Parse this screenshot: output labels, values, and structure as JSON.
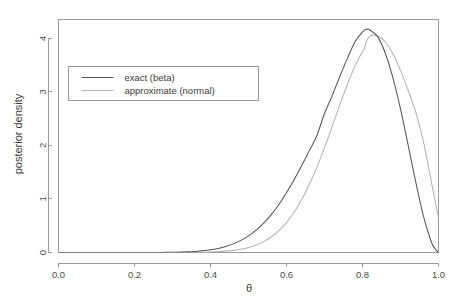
{
  "chart_data": {
    "type": "line",
    "title": "",
    "xlabel": "θ",
    "ylabel": "posterior density",
    "xlim": [
      0.0,
      1.0
    ],
    "ylim": [
      0.0,
      4.35
    ],
    "grid": false,
    "xticks": [
      "0.0",
      "0.2",
      "0.4",
      "0.6",
      "0.8",
      "1.0"
    ],
    "xtick_values": [
      0.0,
      0.2,
      0.4,
      0.6,
      0.8,
      1.0
    ],
    "yticks": [
      "0",
      "1",
      "2",
      "3",
      "4"
    ],
    "ytick_values": [
      0,
      1,
      2,
      3,
      4
    ],
    "legend_position": "upper-left-inset",
    "series": [
      {
        "name": "exact (beta)",
        "color": "#555555",
        "x": [
          0.0,
          0.02,
          0.04,
          0.06,
          0.08,
          0.1,
          0.12,
          0.14,
          0.16,
          0.18,
          0.2,
          0.22,
          0.24,
          0.26,
          0.28,
          0.3,
          0.32,
          0.34,
          0.36,
          0.38,
          0.4,
          0.42,
          0.44,
          0.46,
          0.48,
          0.5,
          0.52,
          0.54,
          0.56,
          0.58,
          0.6,
          0.62,
          0.64,
          0.66,
          0.68,
          0.7,
          0.72,
          0.74,
          0.76,
          0.78,
          0.8,
          0.81,
          0.82,
          0.84,
          0.86,
          0.88,
          0.9,
          0.92,
          0.94,
          0.96,
          0.98,
          0.99,
          1.0
        ],
        "values": [
          0.0,
          0.0,
          0.0,
          0.0,
          0.0,
          0.0,
          0.0,
          0.0,
          0.0,
          0.0,
          0.0,
          0.0,
          0.001,
          0.001,
          0.002,
          0.004,
          0.007,
          0.012,
          0.02,
          0.032,
          0.05,
          0.076,
          0.112,
          0.161,
          0.226,
          0.31,
          0.417,
          0.549,
          0.708,
          0.897,
          1.114,
          1.358,
          1.623,
          1.902,
          2.184,
          2.596,
          2.925,
          3.28,
          3.62,
          3.93,
          4.12,
          4.17,
          4.15,
          4.03,
          3.72,
          3.26,
          2.68,
          2.01,
          1.32,
          0.69,
          0.22,
          0.08,
          0.0
        ]
      },
      {
        "name": "approximate (normal)",
        "color": "#b4b4b4",
        "x": [
          0.0,
          0.05,
          0.1,
          0.15,
          0.2,
          0.25,
          0.3,
          0.35,
          0.38,
          0.4,
          0.42,
          0.44,
          0.46,
          0.48,
          0.5,
          0.52,
          0.54,
          0.56,
          0.58,
          0.6,
          0.62,
          0.64,
          0.66,
          0.68,
          0.7,
          0.72,
          0.74,
          0.76,
          0.78,
          0.8,
          0.805,
          0.81,
          0.82,
          0.84,
          0.86,
          0.88,
          0.9,
          0.92,
          0.94,
          0.96,
          0.98,
          1.0
        ],
        "values": [
          0.0,
          0.0,
          0.0,
          0.0,
          0.0,
          0.0,
          0.001,
          0.003,
          0.006,
          0.01,
          0.016,
          0.026,
          0.04,
          0.062,
          0.094,
          0.139,
          0.203,
          0.29,
          0.407,
          0.558,
          0.75,
          0.986,
          1.268,
          1.594,
          1.958,
          2.348,
          2.748,
          3.133,
          3.477,
          3.752,
          3.8,
          3.935,
          4.04,
          4.045,
          3.93,
          3.71,
          3.4,
          3.03,
          2.62,
          2.08,
          1.36,
          0.65
        ]
      }
    ]
  },
  "axes": {
    "ylabel": "posterior density",
    "xlabel": "θ"
  },
  "legend": {
    "items": [
      {
        "label": "exact (beta)",
        "color": "#555555"
      },
      {
        "label": "approximate (normal)",
        "color": "#b4b4b4"
      }
    ]
  }
}
